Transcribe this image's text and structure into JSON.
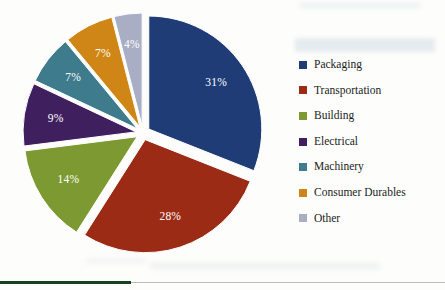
{
  "chart_data": {
    "type": "pie",
    "title": "",
    "subtitle": "",
    "xlabel": "",
    "ylabel": "",
    "grid": false,
    "legend_position": "right",
    "unit": "%",
    "total": 100,
    "categories": [
      "Packaging",
      "Transportation",
      "Building",
      "Electrical",
      "Machinery",
      "Consumer Durables",
      "Other"
    ],
    "values": [
      31,
      28,
      14,
      9,
      7,
      7,
      4
    ],
    "data_labels": [
      "31%",
      "28%",
      "14%",
      "9%",
      "7%",
      "7%",
      "4%"
    ],
    "colors": [
      "#1f3c76",
      "#9c2b16",
      "#7d9a32",
      "#3f1f5e",
      "#3e7b8c",
      "#cf8616",
      "#a9aec4"
    ],
    "exploded": true,
    "start_angle_deg": 0,
    "direction": "clockwise",
    "slices": [
      {
        "label": "Packaging",
        "value": 31,
        "data_label": "31%",
        "color": "#1f3c76",
        "start_deg": 0.0,
        "end_deg": 111.6
      },
      {
        "label": "Transportation",
        "value": 28,
        "data_label": "28%",
        "color": "#9c2b16",
        "start_deg": 111.6,
        "end_deg": 212.4
      },
      {
        "label": "Building",
        "value": 14,
        "data_label": "14%",
        "color": "#7d9a32",
        "start_deg": 212.4,
        "end_deg": 262.8
      },
      {
        "label": "Electrical",
        "value": 9,
        "data_label": "9%",
        "color": "#3f1f5e",
        "start_deg": 262.8,
        "end_deg": 295.2
      },
      {
        "label": "Machinery",
        "value": 7,
        "data_label": "7%",
        "color": "#3e7b8c",
        "start_deg": 295.2,
        "end_deg": 320.4
      },
      {
        "label": "Consumer Durables",
        "value": 7,
        "data_label": "7%",
        "color": "#cf8616",
        "start_deg": 320.4,
        "end_deg": 345.6
      },
      {
        "label": "Other",
        "value": 4,
        "data_label": "4%",
        "color": "#a9aec4",
        "start_deg": 345.6,
        "end_deg": 360.0
      }
    ]
  },
  "legend": {
    "items": [
      {
        "label": "Packaging",
        "color": "#1f3c76"
      },
      {
        "label": "Transportation",
        "color": "#9c2b16"
      },
      {
        "label": "Building",
        "color": "#7d9a32"
      },
      {
        "label": "Electrical",
        "color": "#3f1f5e"
      },
      {
        "label": "Machinery",
        "color": "#3e7b8c"
      },
      {
        "label": "Consumer Durables",
        "color": "#cf8616"
      },
      {
        "label": "Other",
        "color": "#a9aec4"
      }
    ]
  },
  "divider": {
    "accent_color": "#17401f",
    "line_color": "#b9bcbe"
  },
  "geometry": {
    "center_x": 143,
    "center_y": 133,
    "radius": 113,
    "explode_offset": 7,
    "label_radius_ratio": 0.72
  }
}
